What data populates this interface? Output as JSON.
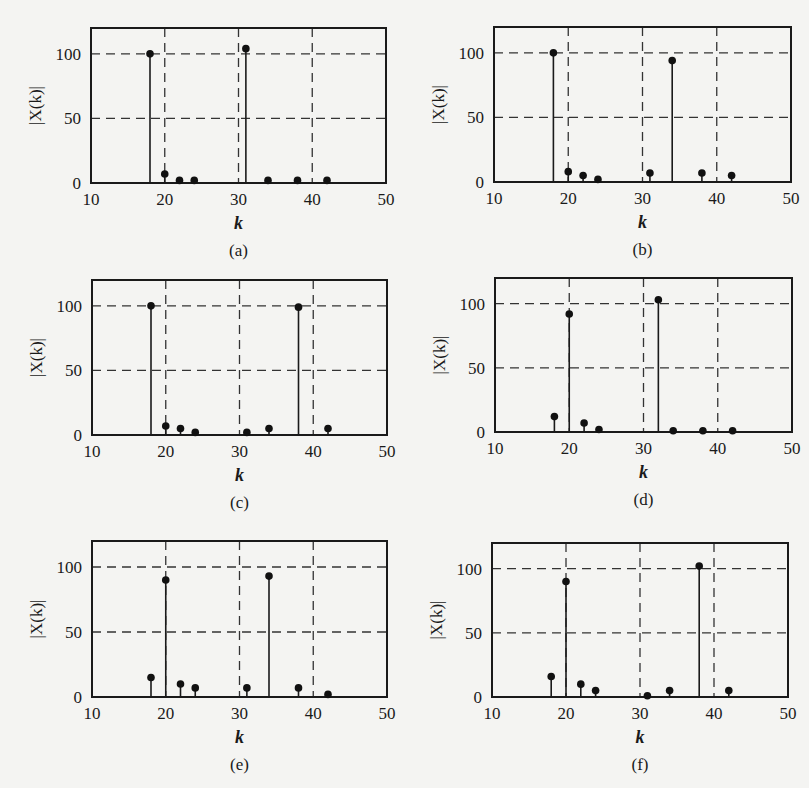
{
  "figure": {
    "x_axis": {
      "label": "k",
      "min": 10,
      "max": 50,
      "ticks": [
        10,
        20,
        30,
        40,
        50
      ]
    },
    "y_axis": {
      "label": "|X(k)|",
      "min": 0,
      "max": 120,
      "ticks": [
        0,
        50,
        100
      ]
    },
    "grid": {
      "style": "dashed",
      "x_lines": [
        20,
        30,
        40
      ],
      "y_lines": [
        50,
        100
      ]
    }
  },
  "chart_data": [
    {
      "id": "a",
      "caption": "(a)",
      "type": "stem",
      "xlabel": "k",
      "ylabel": "|X(k)|",
      "xlim": [
        10,
        50
      ],
      "ylim": [
        0,
        120
      ],
      "grid": true,
      "x": [
        18,
        20,
        22,
        24,
        31,
        34,
        38,
        42
      ],
      "y": [
        100,
        7,
        2,
        2,
        104,
        2,
        2,
        2
      ],
      "gridlines_x": [
        20,
        30,
        40
      ]
    },
    {
      "id": "b",
      "caption": "(b)",
      "type": "stem",
      "xlabel": "k",
      "ylabel": "|X(k)|",
      "xlim": [
        10,
        50
      ],
      "ylim": [
        0,
        120
      ],
      "grid": true,
      "x": [
        18,
        20,
        22,
        24,
        31,
        34,
        38,
        42
      ],
      "y": [
        100,
        8,
        5,
        2,
        7,
        94,
        7,
        5
      ],
      "gridlines_x": [
        20,
        30,
        40
      ]
    },
    {
      "id": "c",
      "caption": "(c)",
      "type": "stem",
      "xlabel": "k",
      "ylabel": "|X(k)|",
      "xlim": [
        10,
        50
      ],
      "ylim": [
        0,
        120
      ],
      "grid": true,
      "x": [
        18,
        20,
        22,
        24,
        31,
        34,
        38,
        42
      ],
      "y": [
        100,
        7,
        5,
        2,
        2,
        5,
        99,
        5
      ],
      "gridlines_x": [
        20,
        30,
        40
      ]
    },
    {
      "id": "d",
      "caption": "(d)",
      "type": "stem",
      "xlabel": "k",
      "ylabel": "|X(k)|",
      "xlim": [
        10,
        50
      ],
      "ylim": [
        0,
        120
      ],
      "grid": true,
      "x": [
        18,
        20,
        22,
        24,
        32,
        34,
        38,
        42
      ],
      "y": [
        12,
        92,
        7,
        2,
        103,
        1,
        1,
        1
      ],
      "gridlines_x": [
        20,
        30,
        40
      ]
    },
    {
      "id": "e",
      "caption": "(e)",
      "type": "stem",
      "xlabel": "k",
      "ylabel": "|X(k)|",
      "xlim": [
        10,
        50
      ],
      "ylim": [
        0,
        120
      ],
      "grid": true,
      "x": [
        18,
        20,
        22,
        24,
        31,
        34,
        38,
        42
      ],
      "y": [
        15,
        90,
        10,
        7,
        7,
        93,
        7,
        2
      ],
      "gridlines_x": [
        20,
        30,
        40
      ]
    },
    {
      "id": "f",
      "caption": "(f)",
      "type": "stem",
      "xlabel": "k",
      "ylabel": "|X(k)|",
      "xlim": [
        10,
        50
      ],
      "ylim": [
        0,
        120
      ],
      "grid": true,
      "x": [
        18,
        20,
        22,
        24,
        31,
        34,
        38,
        42
      ],
      "y": [
        16,
        90,
        10,
        5,
        1,
        5,
        102,
        5
      ],
      "gridlines_x": [
        20,
        30,
        40
      ]
    }
  ],
  "layout": {
    "panels": [
      {
        "left": 91,
        "top": 28,
        "w": 295,
        "h": 155
      },
      {
        "left": 494,
        "top": 27,
        "w": 297,
        "h": 155
      },
      {
        "left": 92,
        "top": 280,
        "w": 295,
        "h": 155
      },
      {
        "left": 495,
        "top": 278,
        "w": 297,
        "h": 154
      },
      {
        "left": 92,
        "top": 541,
        "w": 295,
        "h": 156
      },
      {
        "left": 492,
        "top": 543,
        "w": 296,
        "h": 154
      }
    ]
  }
}
